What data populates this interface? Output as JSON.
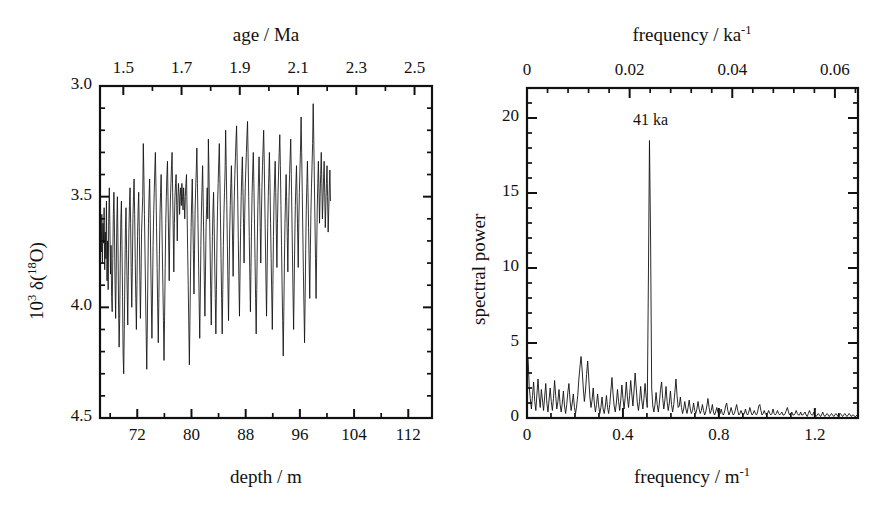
{
  "figure": {
    "background": "#ffffff",
    "ink": "#111111",
    "width": 881,
    "height": 510
  },
  "panels": {
    "left": {
      "name": "oxygen-isotope-depth-series",
      "frame": {
        "x": 100,
        "y": 86,
        "w": 332,
        "h": 332
      },
      "top_axis": {
        "title": "age / Ma",
        "ticks": [
          1.5,
          1.7,
          1.9,
          2.1,
          2.3,
          2.5
        ],
        "tick_labels": [
          "1.5",
          "1.7",
          "1.9",
          "2.1",
          "2.3",
          "2.5"
        ],
        "range": [
          1.42,
          2.56
        ],
        "minor_per_major": 2
      },
      "bottom_axis": {
        "title": "depth / m",
        "ticks": [
          72,
          80,
          88,
          96,
          104,
          112
        ],
        "tick_labels": [
          "72",
          "80",
          "88",
          "96",
          "104",
          "112"
        ],
        "range": [
          66.5,
          115.5
        ],
        "minor_per_major": 2
      },
      "y_axis": {
        "title_html": "10<sup>3</sup> &delta;(<sup>18</sup>O)",
        "ticks": [
          3.0,
          3.5,
          4.0,
          4.5
        ],
        "tick_labels": [
          "3.0",
          "3.5",
          "4.0",
          "4.5"
        ],
        "range": [
          3.0,
          4.5
        ],
        "inverted": true,
        "minor_step": 0.1
      }
    },
    "right": {
      "name": "spectral-power-periodogram",
      "frame": {
        "x": 527,
        "y": 88,
        "w": 331,
        "h": 330
      },
      "top_axis": {
        "title_html": "frequency / ka<sup>-1</sup>",
        "ticks": [
          0,
          0.02,
          0.04,
          0.06
        ],
        "tick_labels": [
          "0",
          "0.02",
          "0.04",
          "0.06"
        ],
        "range": [
          0,
          0.0645
        ],
        "minor_per_major": 5
      },
      "bottom_axis": {
        "title_html": "frequency / m<sup>-1</sup>",
        "ticks": [
          0,
          0.4,
          0.8,
          1.2
        ],
        "tick_labels": [
          "0",
          "0.4",
          "0.8",
          "1.2"
        ],
        "range": [
          0,
          1.38
        ],
        "minor_per_major": 4
      },
      "y_axis": {
        "title": "spectral power",
        "ticks": [
          0,
          5,
          10,
          15,
          20
        ],
        "tick_labels": [
          "0",
          "5",
          "10",
          "15",
          "20"
        ],
        "range": [
          0,
          22
        ],
        "minor_step": 1
      },
      "annotations": [
        {
          "text": "41 ka",
          "freq_m": 0.515,
          "power": 19.9
        }
      ]
    }
  },
  "chart_data": [
    {
      "type": "line",
      "name": "delta-18O-vs-depth",
      "title": "",
      "xlabel": "depth / m",
      "xlabel_secondary": "age / Ma",
      "ylabel": "10^3 delta(18O)",
      "xlim": [
        66.5,
        115.5
      ],
      "ylim": [
        4.5,
        3.0
      ],
      "y_inverted": true,
      "grid": false,
      "legend": "none",
      "x_secondary_lim": [
        1.42,
        2.56
      ],
      "sampling_note": "high-resolution benthic oxygen-isotope record, ~0.08 m spacing",
      "x_start": 66.6,
      "x_step": 0.085,
      "values": [
        3.62,
        3.75,
        3.58,
        3.8,
        3.62,
        3.71,
        3.55,
        3.83,
        3.66,
        3.78,
        3.52,
        3.88,
        3.7,
        3.92,
        3.6,
        3.46,
        3.63,
        3.85,
        3.72,
        3.95,
        4.02,
        3.78,
        3.58,
        3.48,
        3.66,
        3.9,
        4.05,
        3.84,
        3.62,
        3.5,
        3.7,
        3.98,
        4.18,
        4.05,
        3.8,
        3.6,
        3.52,
        3.72,
        3.95,
        4.22,
        4.3,
        4.1,
        3.86,
        3.64,
        3.55,
        3.74,
        3.92,
        4.08,
        3.86,
        3.66,
        3.54,
        3.46,
        3.62,
        3.84,
        4.0,
        3.82,
        3.6,
        3.5,
        3.42,
        3.58,
        3.78,
        3.96,
        4.1,
        3.9,
        3.68,
        3.56,
        3.48,
        3.64,
        3.86,
        4.05,
        3.88,
        3.66,
        3.58,
        3.5,
        3.26,
        3.4,
        3.58,
        3.76,
        3.94,
        4.12,
        4.28,
        4.08,
        3.84,
        3.62,
        3.5,
        3.42,
        3.6,
        3.8,
        3.98,
        4.14,
        3.94,
        3.72,
        3.58,
        3.48,
        3.38,
        3.3,
        3.46,
        3.64,
        3.82,
        4.0,
        4.16,
        3.96,
        3.76,
        3.58,
        3.48,
        3.4,
        3.56,
        3.74,
        3.9,
        4.06,
        4.24,
        4.04,
        3.82,
        3.62,
        3.5,
        3.4,
        3.34,
        3.52,
        3.7,
        3.88,
        3.66,
        3.52,
        3.44,
        3.36,
        3.3,
        3.48,
        3.66,
        3.84,
        3.62,
        3.5,
        3.44,
        3.4,
        3.54,
        3.7,
        3.52,
        3.44,
        3.48,
        3.58,
        3.5,
        3.46,
        3.54,
        3.44,
        3.5,
        3.56,
        3.46,
        3.52,
        3.6,
        3.5,
        3.44,
        3.4,
        3.56,
        3.74,
        3.9,
        4.08,
        4.26,
        4.06,
        3.84,
        3.64,
        3.52,
        3.42,
        3.58,
        3.76,
        3.94,
        3.74,
        3.56,
        3.46,
        3.38,
        3.28,
        3.44,
        3.62,
        3.8,
        3.98,
        4.14,
        3.94,
        3.72,
        3.56,
        3.46,
        3.36,
        3.52,
        3.7,
        3.88,
        4.04,
        3.84,
        3.64,
        3.54,
        3.46,
        3.6,
        3.24,
        3.38,
        3.56,
        3.74,
        3.92,
        4.08,
        3.88,
        3.68,
        3.56,
        3.48,
        3.62,
        3.8,
        3.96,
        4.12,
        3.92,
        3.7,
        3.54,
        3.44,
        3.34,
        3.26,
        3.42,
        3.6,
        3.78,
        3.96,
        4.12,
        3.92,
        3.72,
        3.58,
        3.48,
        3.38,
        3.2,
        3.36,
        3.54,
        3.72,
        3.9,
        4.06,
        3.86,
        3.66,
        3.54,
        3.44,
        3.36,
        3.52,
        3.7,
        3.86,
        3.66,
        3.5,
        3.4,
        3.32,
        3.24,
        3.18,
        3.34,
        3.52,
        3.7,
        3.88,
        4.04,
        3.84,
        3.64,
        3.5,
        3.4,
        3.32,
        3.46,
        3.62,
        3.8,
        3.6,
        3.46,
        3.38,
        3.3,
        3.22,
        3.16,
        3.32,
        3.5,
        3.68,
        3.86,
        4.02,
        3.82,
        3.62,
        3.48,
        3.38,
        3.3,
        3.44,
        3.6,
        3.78,
        3.96,
        4.12,
        3.92,
        3.7,
        3.54,
        3.42,
        3.32,
        3.46,
        3.64,
        3.8,
        3.6,
        3.46,
        3.36,
        3.28,
        3.2,
        3.34,
        3.52,
        3.7,
        3.88,
        4.04,
        3.84,
        3.64,
        3.5,
        3.4,
        3.3,
        3.44,
        3.62,
        3.78,
        3.94,
        4.1,
        3.9,
        3.68,
        3.52,
        3.42,
        3.34,
        3.48,
        3.66,
        3.82,
        3.62,
        3.48,
        3.38,
        3.3,
        3.22,
        3.36,
        3.54,
        3.72,
        3.9,
        4.06,
        4.22,
        4.02,
        3.8,
        3.62,
        3.5,
        3.4,
        3.52,
        3.68,
        3.84,
        3.64,
        3.5,
        3.4,
        3.32,
        3.24,
        3.4,
        3.58,
        3.76,
        3.94,
        4.1,
        3.9,
        3.7,
        3.54,
        3.44,
        3.36,
        3.5,
        3.66,
        3.82,
        3.62,
        3.48,
        3.38,
        3.28,
        3.14,
        3.3,
        3.48,
        3.66,
        3.84,
        4.0,
        4.16,
        3.96,
        3.74,
        3.56,
        3.44,
        3.34,
        3.48,
        3.64,
        3.8,
        3.96,
        3.76,
        3.58,
        3.46,
        3.36,
        3.26,
        3.08,
        3.24,
        3.42,
        3.6,
        3.78,
        3.96,
        3.76,
        3.56,
        3.44,
        3.34,
        3.46,
        3.62,
        3.5,
        3.4,
        3.3,
        3.44,
        3.6,
        3.52,
        3.42,
        3.34,
        3.48,
        3.64,
        3.54,
        3.44,
        3.36,
        3.5,
        3.66,
        3.56,
        3.46,
        3.38,
        3.52
      ]
    },
    {
      "type": "line",
      "name": "spectral-power-vs-frequency",
      "title": "",
      "xlabel": "frequency / m^-1",
      "xlabel_secondary": "frequency / ka^-1",
      "ylabel": "spectral power",
      "xlim": [
        0,
        1.38
      ],
      "ylim": [
        0,
        22
      ],
      "grid": false,
      "legend": "none",
      "peak": {
        "label": "41 ka",
        "frequency_m": 0.515,
        "power": 18.5
      },
      "secondary_peaks": [
        {
          "frequency_m": 0.02,
          "power": 4.3
        },
        {
          "frequency_m": 0.27,
          "power": 4.1
        },
        {
          "frequency_m": 0.44,
          "power": 2.7
        },
        {
          "frequency_m": 0.62,
          "power": 2.3
        },
        {
          "frequency_m": 0.7,
          "power": 2.6
        },
        {
          "frequency_m": 0.88,
          "power": 1.3
        },
        {
          "frequency_m": 1.07,
          "power": 1.0
        }
      ],
      "x_start": 0.0,
      "x_step": 0.0046,
      "values": [
        4.3,
        3.9,
        2.1,
        1.3,
        0.6,
        1.5,
        2.4,
        1.1,
        0.5,
        1.6,
        2.6,
        1.4,
        0.7,
        1.9,
        1.2,
        0.5,
        1.4,
        2.3,
        1.0,
        0.4,
        1.2,
        2.0,
        1.1,
        0.5,
        1.3,
        2.5,
        1.5,
        0.6,
        1.1,
        1.9,
        0.9,
        0.4,
        1.0,
        1.8,
        0.8,
        0.3,
        0.9,
        1.7,
        2.3,
        1.2,
        0.5,
        1.0,
        1.6,
        0.7,
        0.3,
        0.8,
        1.5,
        2.6,
        3.4,
        4.1,
        3.2,
        2.0,
        1.1,
        1.8,
        2.9,
        3.8,
        2.6,
        1.4,
        0.7,
        1.2,
        2.0,
        1.0,
        0.4,
        0.9,
        1.6,
        0.8,
        0.3,
        0.7,
        1.4,
        0.6,
        0.3,
        0.8,
        1.5,
        0.7,
        0.3,
        0.9,
        1.8,
        2.7,
        1.6,
        0.8,
        0.4,
        1.0,
        1.9,
        1.1,
        0.5,
        1.2,
        2.2,
        1.3,
        0.6,
        1.4,
        2.4,
        1.4,
        0.7,
        1.5,
        2.5,
        1.6,
        0.8,
        1.8,
        3.0,
        2.0,
        1.0,
        0.5,
        1.1,
        2.1,
        1.2,
        0.6,
        1.3,
        2.3,
        1.4,
        0.7,
        9.0,
        18.5,
        12.0,
        2.0,
        0.8,
        0.4,
        0.9,
        1.7,
        0.9,
        0.4,
        1.0,
        1.9,
        2.4,
        1.3,
        0.6,
        1.2,
        2.1,
        1.1,
        0.5,
        1.0,
        1.8,
        0.9,
        0.4,
        0.9,
        1.7,
        2.6,
        1.5,
        0.7,
        0.8,
        1.4,
        0.7,
        0.3,
        0.6,
        1.1,
        0.6,
        0.3,
        0.7,
        1.2,
        0.6,
        0.3,
        0.5,
        1.0,
        0.5,
        0.3,
        0.6,
        1.1,
        0.6,
        0.3,
        0.5,
        0.9,
        0.5,
        0.2,
        0.4,
        0.8,
        1.3,
        0.7,
        0.3,
        0.5,
        0.9,
        0.4,
        0.2,
        0.4,
        0.7,
        0.4,
        0.2,
        0.3,
        0.6,
        0.3,
        0.2,
        0.4,
        0.8,
        1.0,
        0.5,
        0.2,
        0.4,
        0.7,
        0.4,
        0.2,
        0.3,
        0.6,
        0.9,
        0.5,
        0.2,
        0.3,
        0.5,
        0.3,
        0.2,
        0.3,
        0.6,
        0.3,
        0.2,
        0.4,
        0.7,
        0.4,
        0.2,
        0.3,
        0.5,
        0.3,
        0.2,
        0.4,
        0.8,
        0.9,
        0.5,
        0.2,
        0.3,
        0.5,
        0.3,
        0.2,
        0.3,
        0.5,
        0.3,
        0.2,
        0.3,
        0.6,
        0.3,
        0.2,
        0.3,
        0.5,
        0.3,
        0.2,
        0.3,
        0.4,
        0.2,
        0.2,
        0.3,
        0.5,
        0.7,
        0.4,
        0.2,
        0.3,
        0.4,
        0.2,
        0.2,
        0.3,
        0.5,
        0.3,
        0.2,
        0.2,
        0.4,
        0.2,
        0.2,
        0.3,
        0.4,
        0.2,
        0.1,
        0.3,
        0.5,
        0.3,
        0.2,
        0.2,
        0.4,
        0.2,
        0.1,
        0.2,
        0.3,
        0.2,
        0.1,
        0.2,
        0.4,
        0.2,
        0.1,
        0.2,
        0.3,
        0.2,
        0.1,
        0.2,
        0.3,
        0.2,
        0.1,
        0.2,
        0.3,
        0.2,
        0.1,
        0.2,
        0.3,
        0.2,
        0.1,
        0.2,
        0.3,
        0.2,
        0.1,
        0.2,
        0.3,
        0.2,
        0.1,
        0.2,
        0.2,
        0.1,
        0.1,
        0.2
      ]
    }
  ]
}
